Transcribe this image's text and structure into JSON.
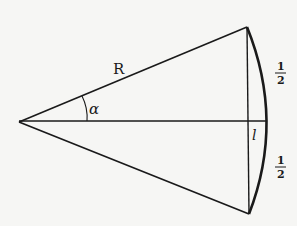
{
  "diagram": {
    "type": "geometry",
    "labels": {
      "radius": "R",
      "angle": "α",
      "sagitta": "l",
      "upper_half_num": "1",
      "upper_half_den": "2",
      "lower_half_num": "1",
      "lower_half_den": "2"
    },
    "points": {
      "apex": [
        19,
        122
      ],
      "top_vertex": [
        247,
        27
      ],
      "bottom_vertex": [
        249,
        214
      ],
      "arc_mid": [
        266,
        121
      ],
      "chord_mid": [
        248,
        121
      ]
    },
    "colors": {
      "background": "#f6f6f4",
      "ink": "#1a1a1a"
    }
  }
}
